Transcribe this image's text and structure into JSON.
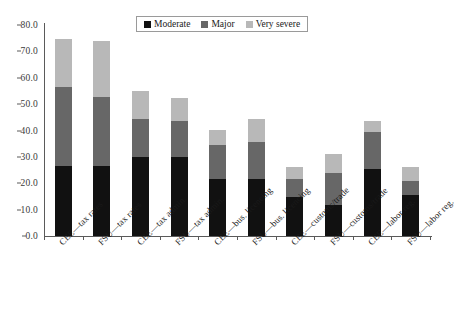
{
  "chart_data": {
    "type": "bar",
    "stacked": true,
    "title": "",
    "subtitle": "",
    "xlabel": "",
    "ylabel": "",
    "ylim": [
      0.0,
      80.0
    ],
    "ytick_step": 10.0,
    "ytick_labels": [
      "0.0",
      "10.0",
      "20.0",
      "30.0",
      "40.0",
      "50.0",
      "60.0",
      "70.0",
      "80.0"
    ],
    "ytick_values": [
      0,
      10,
      20,
      30,
      40,
      50,
      60,
      70,
      80
    ],
    "grid": false,
    "legend_position": "top-center",
    "categories": [
      "CEE—tax rates",
      "FSU—tax rates",
      "CEE—tax admin.",
      "FSU—tax admin.",
      "CEE—bus. licencing",
      "FSU—bus. licencing",
      "CEE—customs/trade",
      "FSU—customs/trade",
      "CEE—labor reg.",
      "FSU—labor reg."
    ],
    "series": [
      {
        "name": "Moderate",
        "color": "#111111",
        "values": [
          26.4,
          26.4,
          30.0,
          29.8,
          21.8,
          21.5,
          14.8,
          11.7,
          25.5,
          15.5
        ]
      },
      {
        "name": "Major",
        "color": "#676767",
        "values": [
          30.1,
          26.4,
          14.3,
          13.8,
          12.7,
          14.0,
          6.7,
          12.3,
          14.0,
          5.5
        ]
      },
      {
        "name": "Very severe",
        "color": "#b8b8b8",
        "values": [
          18.1,
          21.0,
          10.5,
          8.6,
          5.7,
          8.8,
          4.7,
          7.0,
          4.0,
          5.0
        ]
      }
    ],
    "totals": [
      74.6,
      73.8,
      54.8,
      52.2,
      40.2,
      44.3,
      26.2,
      31.0,
      43.5,
      26.0
    ]
  },
  "legend": {
    "items": [
      {
        "label": "Moderate",
        "swatch": "moderate-swatch"
      },
      {
        "label": "Major",
        "swatch": "major-swatch"
      },
      {
        "label": "Very severe",
        "swatch": "very-severe-swatch"
      }
    ]
  }
}
